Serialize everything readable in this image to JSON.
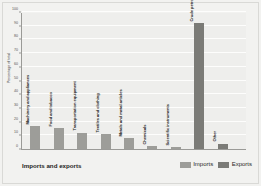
{
  "chart_data": {
    "type": "bar",
    "title": "",
    "xlabel": "Imports and exports",
    "ylabel": "Percentage of total",
    "ylim": [
      0,
      100
    ],
    "yticks": [
      0,
      10,
      20,
      30,
      40,
      50,
      60,
      70,
      80,
      90,
      100
    ],
    "grid": true,
    "legend_position": "bottom-right",
    "categories": [
      "Machinery and appliances",
      "Food and tobacco",
      "Transportation equipment",
      "Textiles and clothing",
      "Metals and metal articles",
      "Chemicals",
      "Scientific instruments",
      "Crude petroleum",
      "Other"
    ],
    "series": [
      {
        "name": "Imports",
        "color": "#9d9d99",
        "values": [
          17,
          15,
          12,
          11,
          8,
          2,
          1.5,
          null,
          null
        ]
      },
      {
        "name": "Exports",
        "color": "#7b7b77",
        "values": [
          null,
          null,
          null,
          null,
          null,
          null,
          null,
          92,
          4
        ]
      }
    ],
    "bars": [
      {
        "label": "Machinery and appliances",
        "series": "Imports",
        "value": 17
      },
      {
        "label": "Food and tobacco",
        "series": "Imports",
        "value": 15
      },
      {
        "label": "Transportation equipment",
        "series": "Imports",
        "value": 12
      },
      {
        "label": "Textiles and clothing",
        "series": "Imports",
        "value": 11
      },
      {
        "label": "Metals and metal articles",
        "series": "Imports",
        "value": 8
      },
      {
        "label": "Chemicals",
        "series": "Imports",
        "value": 2
      },
      {
        "label": "Scientific instruments",
        "series": "Imports",
        "value": 1.5
      },
      {
        "label": "Crude petroleum",
        "series": "Exports",
        "value": 92
      },
      {
        "label": "Other",
        "series": "Exports",
        "value": 4
      }
    ]
  },
  "axis": {
    "y_title": "Percentage of total",
    "y_tick_labels": [
      "0",
      "10",
      "20",
      "30",
      "40",
      "50",
      "60",
      "70",
      "80",
      "90",
      "100"
    ]
  },
  "footer": {
    "x_title": "Imports and exports"
  },
  "legend": {
    "items": [
      {
        "label": "Imports",
        "color": "#9d9d99"
      },
      {
        "label": "Exports",
        "color": "#7b7b77"
      }
    ]
  },
  "colors": {
    "imports": "#9d9d99",
    "exports": "#7b7b77",
    "plot_background": "#eeeeec",
    "figure_background": "#f2f2f0",
    "gridline": "#fdfdfc",
    "axis_line": "#9a9a97"
  }
}
